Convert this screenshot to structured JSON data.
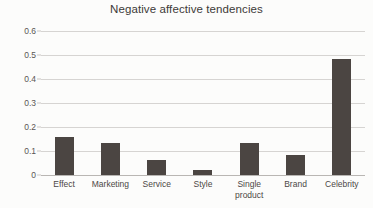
{
  "chart_data": {
    "type": "bar",
    "title": "Negative affective tendencies",
    "xlabel": "",
    "ylabel": "",
    "categories": [
      "Effect",
      "Marketing",
      "Service",
      "Style",
      "Single\nproduct",
      "Brand",
      "Celebrity"
    ],
    "values": [
      0.16,
      0.133,
      0.063,
      0.022,
      0.134,
      0.082,
      0.485
    ],
    "ylim": [
      0,
      0.6
    ],
    "ytick_labels": [
      "0.6",
      "0.5",
      "0.4",
      "0.3",
      "0.2",
      "0.1",
      "0"
    ],
    "ytick_values": [
      0.6,
      0.5,
      0.4,
      0.3,
      0.2,
      0.1,
      0
    ],
    "grid": true,
    "legend": false,
    "legend_position": "none",
    "series": [
      {
        "name": "Negative affective tendencies",
        "values": [
          0.16,
          0.133,
          0.063,
          0.022,
          0.134,
          0.082,
          0.485
        ]
      }
    ],
    "colors": {
      "bar": "#4b4542",
      "gridline": "#d6d4d2",
      "axis": "#b9b6b3",
      "text": "#3d3a38",
      "background": "#fcfcfb"
    }
  }
}
